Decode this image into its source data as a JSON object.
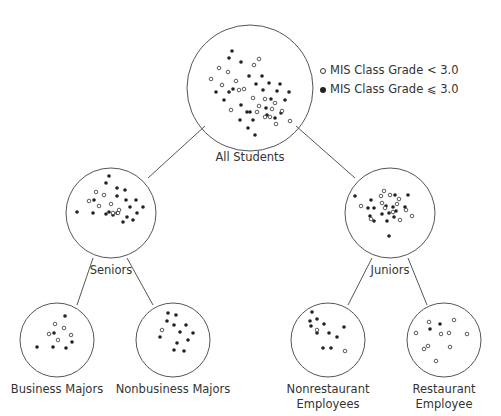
{
  "legend": {
    "items": [
      {
        "symbol": "open-circle",
        "label": "MIS Class Grade < 3.0"
      },
      {
        "symbol": "filled-circle",
        "label": "MIS Class Grade ⩽ 3.0"
      }
    ]
  },
  "nodes": {
    "root": {
      "label": "All Students"
    },
    "seniors": {
      "label": "Seniors"
    },
    "juniors": {
      "label": "Juniors"
    },
    "business": {
      "label": "Business Majors"
    },
    "nonbusiness": {
      "label": "Nonbusiness Majors"
    },
    "nonrestaurant": {
      "label_line1": "Nonrestaurant",
      "label_line2": "Employees"
    },
    "restaurant": {
      "label_line1": "Restaurant",
      "label_line2": "Employee"
    }
  },
  "colors": {
    "stroke": "#555555",
    "dot": "#222222",
    "text": "#333333"
  }
}
